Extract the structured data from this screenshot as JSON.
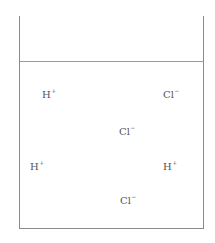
{
  "diagram": {
    "title": "",
    "container": "beaker",
    "colors": {
      "line": "#8a8a8a",
      "text": "#555555"
    },
    "ions": [
      {
        "symbol": "H",
        "charge": "+",
        "x": 42,
        "y": 90
      },
      {
        "symbol": "Cl",
        "charge": "−",
        "x": 163,
        "y": 90
      },
      {
        "symbol": "Cl",
        "charge": "−",
        "x": 119,
        "y": 127
      },
      {
        "symbol": "H",
        "charge": "+",
        "x": 30,
        "y": 162
      },
      {
        "symbol": "H",
        "charge": "+",
        "x": 163,
        "y": 162
      },
      {
        "symbol": "Cl",
        "charge": "−",
        "x": 120,
        "y": 196
      }
    ]
  }
}
